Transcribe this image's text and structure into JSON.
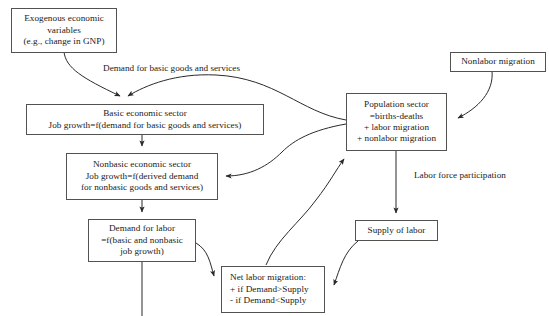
{
  "diagram": {
    "background_color": "#ffffff",
    "stroke_color": "#54524f",
    "text_color": "#1a1a1a",
    "nodes": [
      {
        "id": "exogenous",
        "lines": [
          "Exogenous economic",
          "variables",
          "(e.g., change in GNP)"
        ]
      },
      {
        "id": "basic-sector",
        "lines": [
          "Basic economic sector",
          "Job growth=f(demand for basic goods and services)"
        ]
      },
      {
        "id": "nonbasic-sector",
        "lines": [
          "Nonbasic economic sector",
          "Job growth=f(derived demand",
          "for nonbasic goods and services)"
        ]
      },
      {
        "id": "demand-for-labor",
        "lines": [
          "Demand for labor",
          "=f(basic and nonbasic",
          "job growth)"
        ]
      },
      {
        "id": "net-labor-migration",
        "lines": [
          "Net labor migration:",
          "+ if Demand>Supply",
          "- if Demand<Supply"
        ]
      },
      {
        "id": "population-sector",
        "lines": [
          "Population  sector",
          "=births-deaths",
          "+ labor migration",
          "+ nonlabor migration"
        ]
      },
      {
        "id": "nonlabor-migration",
        "lines": [
          "Nonlabor migration"
        ]
      },
      {
        "id": "supply-of-labor",
        "lines": [
          "Supply of labor"
        ]
      }
    ],
    "edge_labels": [
      {
        "id": "demand-basic-goods",
        "text": "Demand for basic goods and services"
      },
      {
        "id": "labor-force-participation",
        "text": "Labor force participation"
      }
    ]
  }
}
